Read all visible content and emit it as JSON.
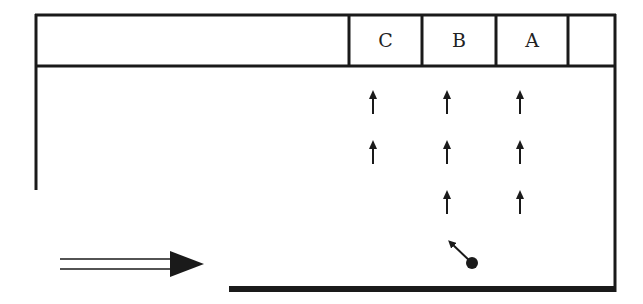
{
  "diagram": {
    "cells": [
      {
        "label": "C",
        "x": 349,
        "w": 73
      },
      {
        "label": "B",
        "x": 422,
        "w": 74
      },
      {
        "label": "A",
        "x": 496,
        "w": 72
      },
      {
        "label": "",
        "x": 568,
        "w": 47
      }
    ],
    "arrow_columns": [
      373,
      447,
      520
    ],
    "arrow_rows": [
      {
        "y": 90,
        "columns": [
          0,
          1,
          2
        ]
      },
      {
        "y": 140,
        "columns": [
          0,
          1,
          2
        ]
      },
      {
        "y": 190,
        "columns": [
          1,
          2
        ]
      }
    ],
    "ball": {
      "cx": 472,
      "cy": 263,
      "r": 6,
      "arrow_to": [
        447,
        239
      ]
    },
    "incoming_arrow": {
      "x1": 60,
      "x2": 204,
      "y": 264
    },
    "colors": {
      "stroke": "#1a1a1a",
      "background": "#ffffff"
    }
  }
}
